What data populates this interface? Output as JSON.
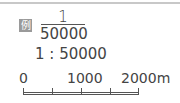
{
  "legend": {
    "badge_label": "例",
    "fraction": {
      "numerator": "1",
      "denominator": "50000"
    },
    "ratio": "1 : 50000"
  },
  "scale_bar": {
    "labels": [
      "0",
      "1000",
      "2000m"
    ],
    "unit": "m",
    "max": 2000,
    "divisions": 4
  }
}
